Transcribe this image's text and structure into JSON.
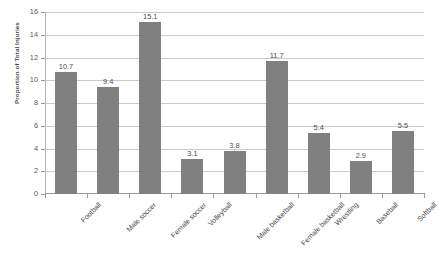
{
  "chart_data": {
    "type": "bar",
    "title": "",
    "xlabel": "",
    "ylabel": "Proportion of Total Injuries",
    "ylim": [
      0,
      16
    ],
    "ytick_step": 2,
    "yticks": [
      16,
      14,
      12,
      10,
      8,
      6,
      4,
      2,
      0
    ],
    "grid": true,
    "legend": "none",
    "bar_color": "#808080",
    "categories": [
      "Football",
      "Male soccer",
      "Female soccer",
      "Volleyball",
      "Male basketball",
      "Female basketball",
      "Wrestling",
      "Baseball",
      "Softball"
    ],
    "values": [
      10.7,
      9.4,
      15.1,
      3.1,
      3.8,
      11.7,
      5.4,
      2.9,
      5.5
    ],
    "value_labels": [
      "10.7",
      "9.4",
      "15.1",
      "3.1",
      "3.8",
      "11.7",
      "5.4",
      "2.9",
      "5.5"
    ]
  }
}
